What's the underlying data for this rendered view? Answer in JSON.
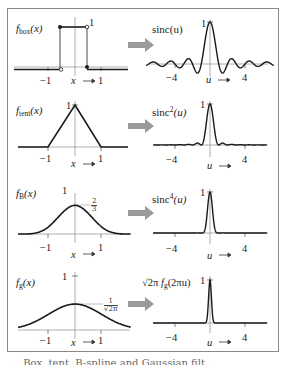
{
  "figure": {
    "caption_partial": "… Box, tent, B-spline and Gaussian filt…",
    "arrow_color": "#9a9a9a",
    "frame_color": "#8a8a8a",
    "curve_color": "#1a1a1a",
    "axis_color": "#8c8c8c"
  },
  "rows": [
    {
      "left": {
        "label": "f",
        "label_sub": "box",
        "label_arg": "(x)",
        "peak_label": "1",
        "ticks": [
          "−1",
          "1"
        ],
        "axis_name": "x",
        "axis_arrow": "→"
      },
      "right": {
        "label": "sinc(u)",
        "peak_label": "1",
        "ticks": [
          "−4",
          "4"
        ],
        "axis_name": "u",
        "axis_arrow": "→"
      }
    },
    {
      "left": {
        "label": "f",
        "label_sub": "tent",
        "label_arg": "(x)",
        "peak_label": "1",
        "ticks": [
          "−1",
          "1"
        ],
        "axis_name": "x",
        "axis_arrow": "→"
      },
      "right": {
        "label": "sinc",
        "label_sup": "2",
        "label_arg": "(u)",
        "peak_label": "1",
        "ticks": [
          "−4",
          "4"
        ],
        "axis_name": "u",
        "axis_arrow": "→"
      }
    },
    {
      "left": {
        "label": "f",
        "label_sub": "B",
        "label_arg": "(x)",
        "peak_label": "1",
        "value_label_num": "2",
        "value_label_den": "3",
        "ticks": [
          "−1",
          "1"
        ],
        "axis_name": "x",
        "axis_arrow": "→"
      },
      "right": {
        "label": "sinc",
        "label_sup": "4",
        "label_arg": "(u)",
        "peak_label": "1",
        "ticks": [
          "−4",
          "4"
        ],
        "axis_name": "u",
        "axis_arrow": "→"
      }
    },
    {
      "left": {
        "label": "f",
        "label_sub": "g",
        "label_arg": "(x)",
        "peak_label": "1",
        "value_label_num": "1",
        "value_label_den": "√2π",
        "ticks": [
          "−1",
          "1"
        ],
        "axis_name": "x",
        "axis_arrow": "→"
      },
      "right": {
        "label_prefix": "√2π",
        "label": "f",
        "label_sub": "g",
        "label_arg": "(2πu)",
        "peak_label": "1",
        "ticks": [
          "−4",
          "4"
        ],
        "axis_name": "u",
        "axis_arrow": "→"
      }
    }
  ],
  "chart_data": [
    {
      "type": "line",
      "title": "f_box(x)",
      "xlabel": "x",
      "x_ticks": [
        -1,
        1
      ],
      "xlim": [
        -2.5,
        2.5
      ],
      "ylim": [
        0,
        1
      ],
      "x": [
        -2.5,
        -0.5,
        -0.5,
        0.5,
        0.5,
        2.5
      ],
      "values": [
        0,
        0,
        1,
        1,
        0,
        0
      ]
    },
    {
      "type": "line",
      "title": "sinc(u)",
      "xlabel": "u",
      "x_ticks": [
        -4,
        4
      ],
      "xlim": [
        -7.5,
        7.5
      ],
      "ylim": [
        -0.22,
        1
      ]
    },
    {
      "type": "line",
      "title": "f_tent(x)",
      "xlabel": "x",
      "x_ticks": [
        -1,
        1
      ],
      "xlim": [
        -2.5,
        2.5
      ],
      "ylim": [
        0,
        1
      ],
      "x": [
        -2.5,
        -1,
        0,
        1,
        2.5
      ],
      "values": [
        0,
        0,
        1,
        0,
        0
      ]
    },
    {
      "type": "line",
      "title": "sinc^2(u)",
      "xlabel": "u",
      "x_ticks": [
        -4,
        4
      ],
      "xlim": [
        -7.5,
        7.5
      ],
      "ylim": [
        0,
        1
      ]
    },
    {
      "type": "line",
      "title": "f_B(x)",
      "xlabel": "x",
      "x_ticks": [
        -1,
        1
      ],
      "xlim": [
        -2.5,
        2.5
      ],
      "ylim": [
        0,
        1
      ],
      "annotations": [
        {
          "y": 0.6667,
          "text": "2/3"
        }
      ],
      "x": [
        -2,
        -1,
        0,
        1,
        2
      ],
      "values": [
        0,
        0.1667,
        0.6667,
        0.1667,
        0
      ]
    },
    {
      "type": "line",
      "title": "sinc^4(u)",
      "xlabel": "u",
      "x_ticks": [
        -4,
        4
      ],
      "xlim": [
        -7.5,
        7.5
      ],
      "ylim": [
        0,
        1
      ]
    },
    {
      "type": "line",
      "title": "f_g(x)",
      "xlabel": "x",
      "x_ticks": [
        -1,
        1
      ],
      "xlim": [
        -2.5,
        2.5
      ],
      "ylim": [
        0,
        1
      ],
      "annotations": [
        {
          "y": 0.3989,
          "text": "1/√(2π)"
        }
      ],
      "x": [
        -2.5,
        -2,
        -1,
        0,
        1,
        2,
        2.5
      ],
      "values": [
        0.0175,
        0.054,
        0.242,
        0.399,
        0.242,
        0.054,
        0.0175
      ]
    },
    {
      "type": "line",
      "title": "√(2π) f_g(2πu)",
      "xlabel": "u",
      "x_ticks": [
        -4,
        4
      ],
      "xlim": [
        -7.5,
        7.5
      ],
      "ylim": [
        0,
        1
      ]
    }
  ]
}
